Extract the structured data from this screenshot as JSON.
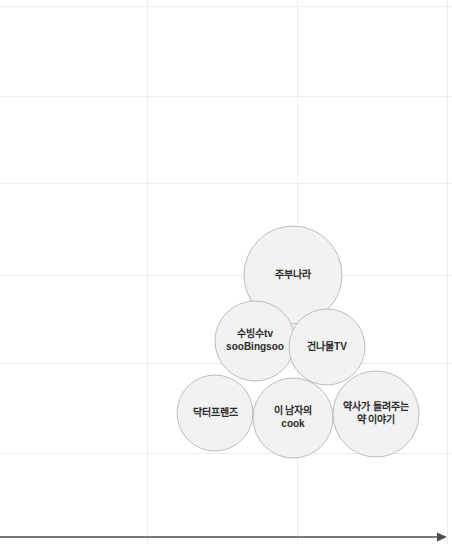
{
  "chart_data": {
    "type": "scatter",
    "title": "",
    "xlabel": "",
    "ylabel": "",
    "grid": true,
    "legend": "none",
    "axis": {
      "x_axis_arrow": "right",
      "x_axis_y_px": 537,
      "x_axis_color": "#4d4d4d"
    },
    "gridlines": {
      "color": "#ededed",
      "vertical_x": [
        147,
        297,
        447
      ],
      "horizontal_y": [
        6,
        96,
        183,
        275,
        363,
        453
      ]
    },
    "bubble_style": {
      "fill": "#f2f2f2",
      "stroke": "#bdbdbd",
      "label_color": "#2b2b2b"
    },
    "bubbles": [
      {
        "id": "jubunara",
        "label_lines": [
          "주부나라"
        ],
        "cx": 293,
        "cy": 275,
        "r": 49
      },
      {
        "id": "soobingsoo",
        "label_lines": [
          "수빙수tv",
          "sooBingsoo"
        ],
        "cx": 255,
        "cy": 341,
        "r": 40
      },
      {
        "id": "gunnamul-tv",
        "label_lines": [
          "건나물TV"
        ],
        "cx": 327,
        "cy": 347,
        "r": 38
      },
      {
        "id": "doctor-friends",
        "label_lines": [
          "닥터프렌즈"
        ],
        "cx": 215,
        "cy": 413,
        "r": 38
      },
      {
        "id": "this-mans-cook",
        "label_lines": [
          "이 남자의",
          "cook"
        ],
        "cx": 293,
        "cy": 418,
        "r": 40
      },
      {
        "id": "pharmacist-medicine-story",
        "label_lines": [
          "약사가 들려주는",
          "약 이야기"
        ],
        "cx": 376,
        "cy": 414,
        "r": 43
      }
    ]
  }
}
